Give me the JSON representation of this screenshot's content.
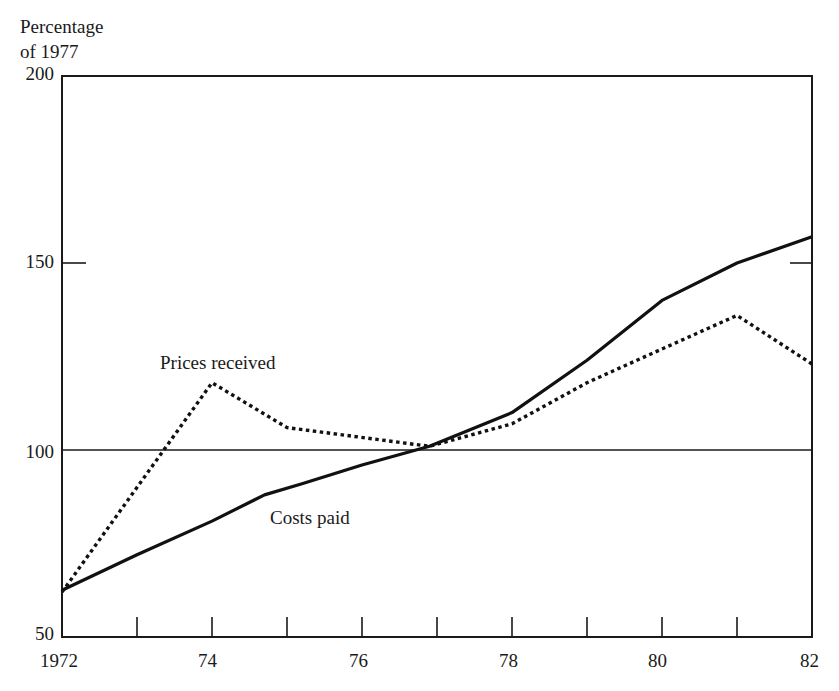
{
  "chart_data": {
    "type": "line",
    "title": "",
    "ylabel": "Percentage of 1977",
    "ylabel_lines": [
      "Percentage",
      "of 1977"
    ],
    "xlabel": "",
    "ylim": [
      50,
      200
    ],
    "xlim": [
      1972,
      1982
    ],
    "yticks": [
      50,
      100,
      150,
      200
    ],
    "ytick_labels": [
      "50",
      "100",
      "150",
      "200"
    ],
    "xticks": [
      1972,
      1973,
      1974,
      1975,
      1976,
      1977,
      1978,
      1979,
      1980,
      1981,
      1982
    ],
    "xtick_labels": [
      "1972",
      "74",
      "76",
      "78",
      "80",
      "82"
    ],
    "reference_line": 100,
    "grid": false,
    "legend": "inline annotations",
    "annotations": [
      "Prices received",
      "Costs paid"
    ],
    "series": [
      {
        "name": "Costs paid",
        "style": "solid",
        "x": [
          1972,
          1973,
          1974,
          1974.7,
          1975.2,
          1976,
          1976.9,
          1978,
          1979,
          1980,
          1981,
          1982
        ],
        "values": [
          62.5,
          72,
          81,
          88,
          91,
          96,
          101,
          110,
          124,
          140,
          150,
          157
        ]
      },
      {
        "name": "Prices received",
        "style": "dotted",
        "x": [
          1972,
          1974,
          1975,
          1976.9,
          1978,
          1979,
          1980,
          1981,
          1982
        ],
        "values": [
          62,
          118,
          106,
          101,
          107,
          118,
          127,
          136,
          123
        ]
      }
    ]
  },
  "labels": {
    "ylabel_line1": "Percentage",
    "ylabel_line2": "of 1977",
    "y200": "200",
    "y150": "150",
    "y100": "100",
    "y50": "50",
    "x1972": "1972",
    "x74": "74",
    "x76": "76",
    "x78": "78",
    "x80": "80",
    "x82": "82",
    "prices_received": "Prices received",
    "costs_paid": "Costs paid"
  }
}
